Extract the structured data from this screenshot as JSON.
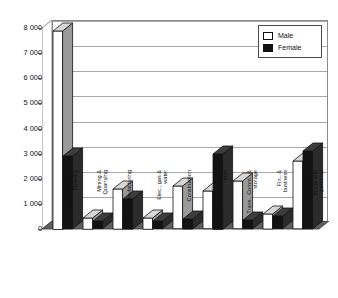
{
  "chart_data": {
    "type": "bar",
    "title": "",
    "subtitle": "",
    "xlabel": "",
    "ylabel": "",
    "grid": true,
    "legend_position": "top-right",
    "ylim": [
      0,
      8000
    ],
    "yticks": [
      0,
      1000,
      2000,
      3000,
      4000,
      5000,
      6000,
      7000,
      8000
    ],
    "ytick_labels": [
      "0",
      "1 000",
      "2 000",
      "3 000",
      "4 000",
      "5 000",
      "6 000",
      "7 000",
      "8 000"
    ],
    "categories": [
      "Agri., Fishery &\nForestry",
      "Mining &\nQuarrying",
      "Manufacturing",
      "Elec., gas &\nwater",
      "Construction",
      "Wholesale &\nretail",
      "Trans., Comm., &\nstorage",
      "Fin., &\nbusiness",
      "Community,\nsocial and\npersonal"
    ],
    "series": [
      {
        "name": "Male",
        "color": "#ffffff",
        "values": [
          7900,
          450,
          1600,
          450,
          1700,
          1500,
          1900,
          600,
          2700
        ]
      },
      {
        "name": "Female",
        "color": "#121212",
        "values": [
          2900,
          300,
          1200,
          300,
          400,
          3000,
          350,
          500,
          3100
        ]
      }
    ]
  },
  "legend": {
    "items": [
      {
        "label": "Male",
        "swatch": "white-square-icon"
      },
      {
        "label": "Female",
        "swatch": "black-square-icon"
      }
    ]
  }
}
